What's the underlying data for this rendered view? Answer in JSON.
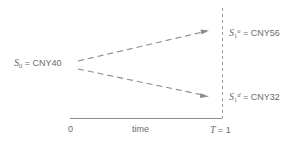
{
  "diagram": {
    "type": "binomial-tree",
    "colors": {
      "line": "#8c8c8c",
      "text": "#6b6b6b",
      "background": "#ffffff"
    },
    "nodes": {
      "initial": {
        "symbol": "S",
        "subscript": "0",
        "superscript": "",
        "equals": "=",
        "value": "CNY40",
        "full_text": "S0 = CNY40"
      },
      "up": {
        "symbol": "S",
        "subscript": "1",
        "superscript": "u",
        "equals": "=",
        "value": "CNY56",
        "full_text": "S1u = CNY56"
      },
      "down": {
        "symbol": "S",
        "subscript": "1",
        "superscript": "d",
        "equals": "=",
        "value": "CNY32",
        "full_text": "S1d = CNY32"
      }
    },
    "axis": {
      "start_label": "0",
      "middle_label": "time",
      "end_symbol": "T",
      "end_equals": "=",
      "end_value": "1",
      "end_label": "T = 1"
    }
  }
}
